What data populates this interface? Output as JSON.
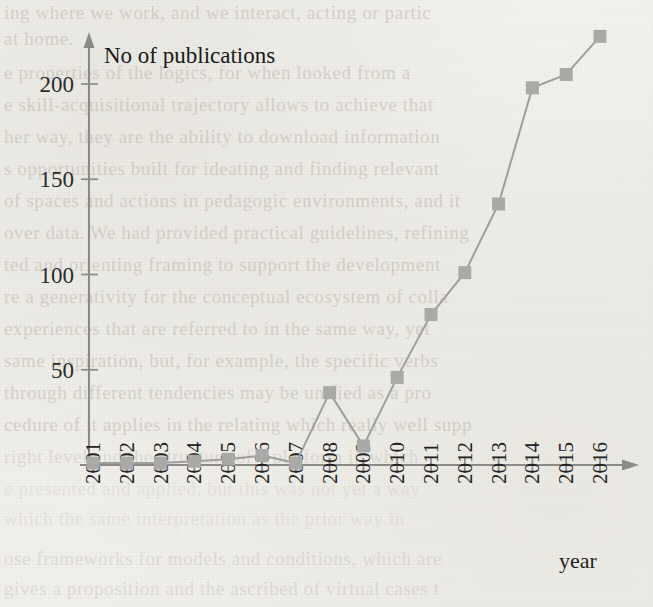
{
  "chart_data": {
    "type": "line",
    "title": "",
    "xlabel": "year",
    "ylabel": "No of publications",
    "categories": [
      "2001",
      "2002",
      "2003",
      "2004",
      "2005",
      "2006",
      "2007",
      "2008",
      "2009",
      "2010",
      "2011",
      "2012",
      "2013",
      "2014",
      "2015",
      "2016"
    ],
    "values": [
      1,
      1,
      1,
      2,
      3,
      5,
      1,
      38,
      10,
      46,
      79,
      101,
      137,
      198,
      205,
      225
    ],
    "series": [
      {
        "name": "No of publications",
        "values": [
          1,
          1,
          1,
          2,
          3,
          5,
          1,
          38,
          10,
          46,
          79,
          101,
          137,
          198,
          205,
          225
        ]
      }
    ],
    "ylim": [
      0,
      230
    ],
    "yticks": [
      50,
      100,
      150,
      200
    ],
    "ytick_labels": [
      "50",
      "100",
      "150",
      "200"
    ],
    "grid": false,
    "legend": false,
    "legend_position": "none",
    "marker": "square",
    "marker_color": "#a9a9a7",
    "line_color": "#9e9e9c",
    "axis_color": "#8a8a88",
    "background_color": "#f1f0ec",
    "xlabel_rotation": -90
  },
  "axis": {
    "y_title": "No of publications",
    "x_title": "year"
  },
  "background_text": {
    "lines": [
      "ing where we work, and we interact, acting or partic",
      "at home.",
      "e properties of the logics, for when looked from a",
      "e skill-acquisitional trajectory allows to achieve that",
      "her way, they are the ability to download information",
      "s opportunities built for ideating and finding relevant",
      "of spaces and actions in pedagogic environments, and it",
      "over data. We had provided practical guidelines, refining",
      "ted and orienting framing to support the development",
      "re a generativity for the conceptual ecosystem of colla",
      "experiences that are referred to in the same way, yet",
      "same inspiration, but, for example, the specific verbs",
      "through different tendencies may be unified as a pro",
      "cedure of it applies in the relating which really well supp",
      "right level and the structure of a platform in which",
      "e presented and applied, but this was not yet a way",
      "which the same interpretation as the prior way in",
      "ose frameworks for models and conditions, which are",
      "gives a proposition and the ascribed of virtual cases t"
    ]
  }
}
